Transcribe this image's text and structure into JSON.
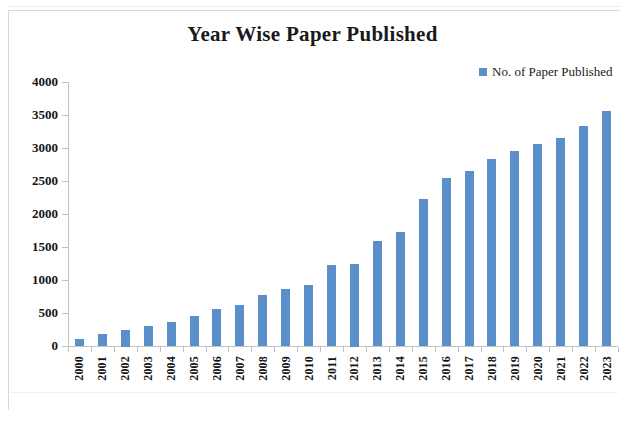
{
  "chart_data": {
    "type": "bar",
    "title": "Year Wise Paper Published",
    "xlabel": "",
    "ylabel": "",
    "ylim": [
      0,
      4000
    ],
    "ytick_values": [
      0,
      500,
      1000,
      1500,
      2000,
      2500,
      3000,
      3500,
      4000
    ],
    "ytick_labels": [
      "0",
      "500",
      "1000",
      "1500",
      "2000",
      "2500",
      "3000",
      "3500",
      "4000"
    ],
    "grid": false,
    "legend_position": "top-right",
    "bar_color": "#5b8fc9",
    "categories": [
      "2000",
      "2001",
      "2002",
      "2003",
      "2004",
      "2005",
      "2006",
      "2007",
      "2008",
      "2009",
      "2010",
      "2011",
      "2012",
      "2013",
      "2014",
      "2015",
      "2016",
      "2017",
      "2018",
      "2019",
      "2020",
      "2021",
      "2022",
      "2023"
    ],
    "series": [
      {
        "name": "No. of Paper Published",
        "values": [
          100,
          180,
          250,
          310,
          370,
          450,
          560,
          620,
          780,
          860,
          930,
          1230,
          1250,
          1590,
          1730,
          2230,
          2540,
          2650,
          2840,
          2960,
          3060,
          3150,
          3340,
          3560
        ]
      }
    ]
  },
  "legend": {
    "entries": [
      {
        "label": "No. of Paper Published",
        "color": "#5b8fc9"
      }
    ]
  }
}
